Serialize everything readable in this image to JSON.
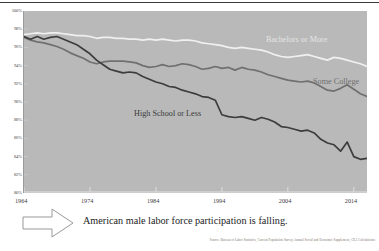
{
  "caption": {
    "text": "American male labor force participation is falling.",
    "arrow_icon": "right-arrow-icon"
  },
  "source_note": "Source: Bureau of Labor Statistics, Current Population Survey Annual Social and Economic Supplement, CEA Calculations",
  "colors": {
    "plot_background": "#b9b9b9",
    "bachelors": "#f0f0f0",
    "some_college": "#707070",
    "high_school": "#3d3d3d",
    "axis_text": "#4a4a4a",
    "caption_text": "#1c1c1c",
    "source_text": "#7a6f68"
  },
  "chart_data": {
    "type": "line",
    "title": "",
    "subtitle": "",
    "xlabel": "",
    "ylabel": "",
    "xlim": [
      1964,
      2016
    ],
    "ylim": [
      80,
      100
    ],
    "grid": false,
    "legend_position": "inline-labels",
    "xticks": [
      "1964",
      "1974",
      "1984",
      "1994",
      "2004",
      "2014"
    ],
    "xtick_values": [
      1964,
      1974,
      1984,
      1994,
      2004,
      2014
    ],
    "yticks": [
      "100%",
      "98%",
      "96%",
      "94%",
      "92%",
      "90%",
      "88%",
      "86%",
      "84%",
      "82%",
      "80%"
    ],
    "ytick_values": [
      100,
      98,
      96,
      94,
      92,
      90,
      88,
      86,
      84,
      82,
      80
    ],
    "x": [
      1964,
      1965,
      1966,
      1967,
      1968,
      1969,
      1970,
      1971,
      1972,
      1973,
      1974,
      1975,
      1976,
      1977,
      1978,
      1979,
      1980,
      1981,
      1982,
      1983,
      1984,
      1985,
      1986,
      1987,
      1988,
      1989,
      1990,
      1991,
      1992,
      1993,
      1994,
      1995,
      1996,
      1997,
      1998,
      1999,
      2000,
      2001,
      2002,
      2003,
      2004,
      2005,
      2006,
      2007,
      2008,
      2009,
      2010,
      2011,
      2012,
      2013,
      2014,
      2015,
      2016
    ],
    "series": [
      {
        "name": "Bachelors or More",
        "color": "#f0f0f0",
        "values": [
          97.4,
          97.5,
          97.6,
          97.5,
          97.6,
          97.6,
          97.5,
          97.4,
          97.3,
          97.3,
          97.2,
          97.0,
          97.1,
          97.1,
          97.0,
          97.0,
          96.9,
          96.9,
          96.8,
          96.9,
          96.8,
          96.9,
          96.8,
          96.7,
          96.8,
          96.8,
          96.7,
          96.5,
          96.4,
          96.3,
          96.2,
          96.0,
          95.9,
          96.0,
          95.9,
          95.8,
          95.7,
          95.5,
          95.2,
          95.0,
          94.9,
          95.0,
          95.1,
          95.2,
          95.0,
          94.8,
          94.6,
          94.9,
          94.8,
          94.6,
          94.4,
          94.2,
          93.9
        ]
      },
      {
        "name": "Some College",
        "color": "#707070",
        "values": [
          97.1,
          96.8,
          96.6,
          96.5,
          96.3,
          96.1,
          95.8,
          95.4,
          95.1,
          94.8,
          94.4,
          94.2,
          94.4,
          94.5,
          94.5,
          94.5,
          94.4,
          94.3,
          94.0,
          93.8,
          93.9,
          94.1,
          93.9,
          94.0,
          94.2,
          94.1,
          93.9,
          93.6,
          93.7,
          93.9,
          93.7,
          93.8,
          93.5,
          93.8,
          93.6,
          93.5,
          93.3,
          93.0,
          92.8,
          92.6,
          92.4,
          92.3,
          92.2,
          92.3,
          92.1,
          91.7,
          91.3,
          91.2,
          91.5,
          91.9,
          91.4,
          90.9,
          90.6
        ]
      },
      {
        "name": "High School or Less",
        "color": "#3d3d3d",
        "values": [
          97.2,
          96.9,
          97.2,
          96.9,
          97.1,
          97.2,
          96.9,
          96.6,
          96.3,
          95.8,
          95.3,
          94.6,
          94.1,
          93.6,
          93.4,
          93.2,
          93.3,
          93.2,
          92.8,
          92.5,
          92.2,
          92.0,
          91.7,
          91.6,
          91.3,
          91.1,
          90.9,
          90.6,
          90.5,
          90.2,
          88.6,
          88.4,
          88.3,
          88.4,
          88.2,
          88.0,
          88.3,
          88.1,
          87.8,
          87.3,
          87.2,
          87.0,
          86.8,
          86.9,
          86.6,
          85.9,
          85.5,
          85.3,
          84.6,
          85.6,
          84.0,
          83.7,
          83.8
        ]
      }
    ]
  }
}
